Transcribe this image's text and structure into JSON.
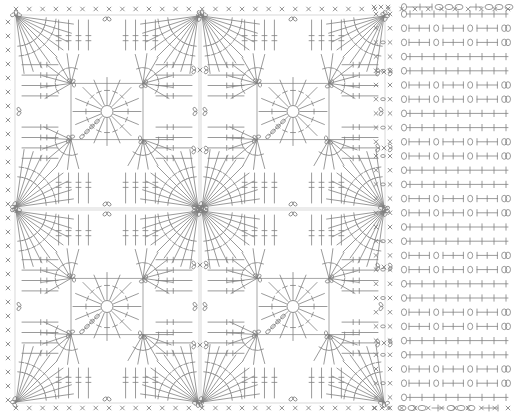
{
  "document": {
    "kind": "crochet-stitch-chart",
    "title": "Crochet pattern chart — granny square motifs with side border",
    "width": 516,
    "height": 419,
    "background_color": "#ffffff",
    "ink_color": "#808080",
    "ink_color_dark": "#6b6b6b"
  },
  "legend_symbols": [
    {
      "name": "chain-stitch",
      "glyph": "○",
      "meaning": "chain (ch)"
    },
    {
      "name": "single-crochet",
      "glyph": "×",
      "meaning": "single crochet (sc)"
    },
    {
      "name": "double-crochet",
      "glyph": "†",
      "meaning": "double crochet (dc) — vertical bar with one crossbar"
    },
    {
      "name": "picot-loop",
      "glyph": "⍜",
      "meaning": "picot / chain loop at corner"
    },
    {
      "name": "join-symbol",
      "glyph": "⟩×⟨",
      "meaning": "join motifs together"
    }
  ],
  "layout": {
    "motif_panel": {
      "name": "motif-panel",
      "x": 14,
      "y": 14,
      "width": 372,
      "height": 390,
      "grid_cols": 2,
      "grid_rows": 2,
      "motif_count": 4,
      "motif_width": 186,
      "motif_height": 195
    },
    "border_panel": {
      "name": "border-panel",
      "x": 386,
      "y": 8,
      "width": 126,
      "height": 404,
      "row_count": 28,
      "row_height": 14.2,
      "repeat_rows": 4
    },
    "top_border": {
      "name": "top-chain-border",
      "y": 9,
      "stitch_count": 38,
      "symbol": "×"
    },
    "bottom_border": {
      "name": "bottom-chain-border",
      "y": 408,
      "stitch_count": 38,
      "symbol": "×"
    },
    "left_border": {
      "name": "left-chain-border",
      "x": 8,
      "stitch_count": 28,
      "symbol": "×"
    }
  },
  "chart_data": {
    "type": "diagram",
    "motif": {
      "name": "granny-square-motif",
      "center_ring_radius": 6,
      "rounds": [
        {
          "round": 1,
          "label": "center ring",
          "stitches": 16,
          "symbol": "double-crochet"
        },
        {
          "round": 2,
          "label": "fan rounds",
          "stitches": 24,
          "symbol": "double-crochet"
        },
        {
          "round": 3,
          "label": "corner picots",
          "stitches": 4,
          "symbol": "picot-loop"
        },
        {
          "round": 4,
          "label": "edge rows",
          "stitches": 32,
          "symbol": "double-crochet"
        }
      ],
      "corner_picot_positions": [
        "top-left",
        "top-right",
        "bottom-left",
        "bottom-right"
      ],
      "radial_fan_count": 8,
      "fan_spokes_each": 7
    },
    "border_pattern": {
      "name": "side-border-pattern",
      "repeat": 4,
      "rows": [
        {
          "row": 1,
          "left": "× o ×",
          "segments": "mesh row: dc, ch, dc across"
        },
        {
          "row": 2,
          "left": "×   ×",
          "segments": "loop row: ch-loops between dc bars"
        },
        {
          "row": 3,
          "left": "× o ×",
          "segments": "loop row: ch-loops between dc bars"
        },
        {
          "row": 4,
          "left": "×   ×",
          "segments": "mesh row: dc, ch, dc across"
        }
      ],
      "top_row": {
        "label": "chain top",
        "symbols": [
          "×",
          "×",
          "×",
          "○",
          "○",
          "○"
        ]
      },
      "bottom_row": {
        "label": "chain foundation",
        "symbols": [
          "×",
          "×",
          "×",
          "○",
          "○",
          "○"
        ]
      }
    }
  },
  "annotations": {
    "motif_join_marks": 6,
    "join_label": "⟩×⟨"
  }
}
